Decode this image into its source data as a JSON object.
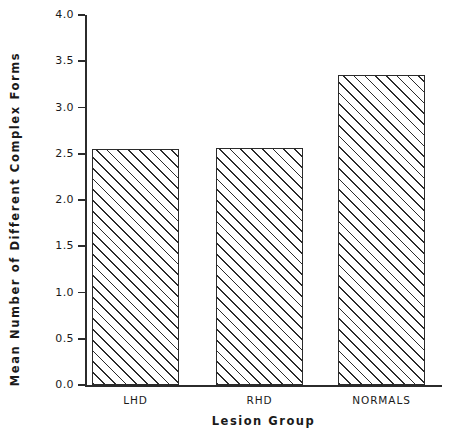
{
  "chart_data": {
    "type": "bar",
    "title": "",
    "categories": [
      "LHD",
      "RHD",
      "NORMALS"
    ],
    "values": [
      2.55,
      2.56,
      3.35
    ],
    "xlabel": "Lesion Group",
    "ylabel": "Mean Number of Different Complex Forms",
    "ylim": [
      0.0,
      4.0
    ],
    "yticks": [
      "0.0",
      "0.5",
      "1.0",
      "1.5",
      "2.0",
      "2.5",
      "3.0",
      "3.5",
      "4.0"
    ],
    "ytick_values": [
      0.0,
      0.5,
      1.0,
      1.5,
      2.0,
      2.5,
      3.0,
      3.5,
      4.0
    ],
    "grid": false,
    "legend": false,
    "bar_fill": "hatched-diagonal",
    "colors": {
      "axis": "#2b2b2b",
      "bar_edge": "#2b2b2b",
      "bar_hatch": "#2b2b2b",
      "background": "#ffffff",
      "text": "#1a1a1a"
    }
  }
}
